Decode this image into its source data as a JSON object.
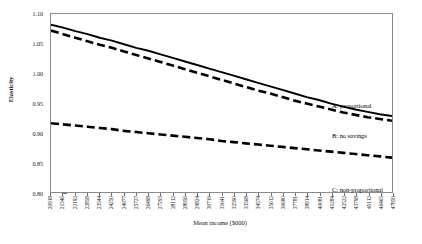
{
  "chart_data": {
    "type": "line",
    "title": "",
    "xlabel": "Mean income ($000)",
    "ylabel": "Elasticity",
    "ylim": [
      0.8,
      1.1
    ],
    "y_ticks": [
      "0.80",
      "0.85",
      "0.90",
      "0.95",
      "1.00",
      "1.05",
      "1.10"
    ],
    "y_tick_values": [
      0.8,
      0.85,
      0.9,
      0.95,
      1.0,
      1.05,
      1.1
    ],
    "grid": false,
    "legend_position": "inline-annotations",
    "categories": [
      "20918",
      "21546",
      "22192",
      "22858",
      "23544",
      "24250",
      "24977",
      "25727",
      "26498",
      "27293",
      "28112",
      "28956",
      "29824",
      "30719",
      "31641",
      "32590",
      "33568",
      "34574",
      "35612",
      "36680",
      "37781",
      "38914",
      "40081",
      "41284",
      "42522",
      "43798",
      "45112",
      "46465",
      "47859"
    ],
    "series": [
      {
        "name": "A: proportional",
        "style": "solid",
        "color": "#000000",
        "values": [
          1.082,
          1.077,
          1.071,
          1.066,
          1.06,
          1.055,
          1.049,
          1.043,
          1.038,
          1.032,
          1.026,
          1.02,
          1.014,
          1.008,
          1.002,
          0.996,
          0.99,
          0.984,
          0.978,
          0.972,
          0.966,
          0.96,
          0.955,
          0.949,
          0.944,
          0.939,
          0.935,
          0.931,
          0.928
        ]
      },
      {
        "name": "B: no savings",
        "style": "dashed",
        "color": "#000000",
        "values": [
          1.072,
          1.066,
          1.06,
          1.054,
          1.048,
          1.043,
          1.037,
          1.031,
          1.025,
          1.019,
          1.013,
          1.007,
          1.001,
          0.995,
          0.989,
          0.983,
          0.977,
          0.971,
          0.966,
          0.96,
          0.954,
          0.949,
          0.944,
          0.939,
          0.934,
          0.93,
          0.926,
          0.923,
          0.92
        ]
      },
      {
        "name": "C: non-proportional",
        "style": "dashed",
        "color": "#000000",
        "values": [
          0.916,
          0.914,
          0.912,
          0.91,
          0.908,
          0.906,
          0.903,
          0.901,
          0.899,
          0.897,
          0.895,
          0.893,
          0.891,
          0.889,
          0.886,
          0.884,
          0.882,
          0.88,
          0.878,
          0.876,
          0.874,
          0.872,
          0.87,
          0.868,
          0.866,
          0.864,
          0.862,
          0.86,
          0.858
        ]
      }
    ],
    "annotations": [
      {
        "text": "A: proportional",
        "series": "A"
      },
      {
        "text": "B: no savings",
        "series": "B"
      },
      {
        "text": "C: non-proportional",
        "series": "C"
      }
    ]
  }
}
